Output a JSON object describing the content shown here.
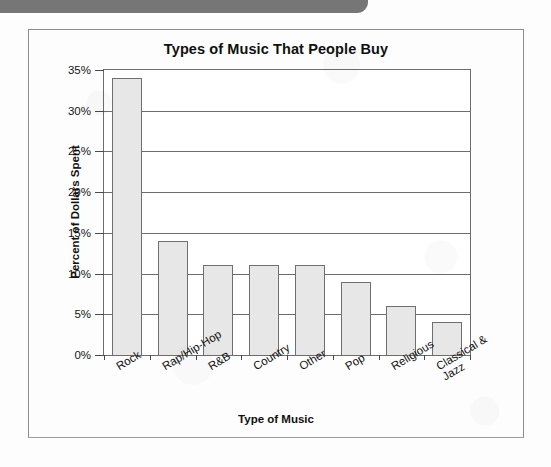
{
  "page": {
    "banner": {
      "name": "top-banner",
      "color": "#767676"
    },
    "frame_border_color": "#8c8c8c"
  },
  "chart_data": {
    "type": "bar",
    "title": "Types of Music That People Buy",
    "xlabel": "Type of Music",
    "ylabel": "Percent of Dollars Spent",
    "categories": [
      "Rock",
      "Rap/Hip-Hop",
      "R&B",
      "Country",
      "Other",
      "Pop",
      "Religious",
      "Classical & Jazz"
    ],
    "category_lines": [
      [
        "Rock"
      ],
      [
        "Rap/Hip-Hop"
      ],
      [
        "R&B"
      ],
      [
        "Country"
      ],
      [
        "Other"
      ],
      [
        "Pop"
      ],
      [
        "Religious"
      ],
      [
        "Classical &",
        "Jazz"
      ]
    ],
    "values": [
      34,
      14,
      11,
      11,
      11,
      9,
      6,
      4
    ],
    "value_unit": "%",
    "ylim": [
      0,
      35
    ],
    "ytick_values": [
      0,
      5,
      10,
      15,
      20,
      25,
      30,
      35
    ],
    "ytick_labels": [
      "0%",
      "5%",
      "10%",
      "15%",
      "20%",
      "25%",
      "30%",
      "35%"
    ],
    "grid": "horizontal",
    "legend": "none",
    "bar_fill_color": "#e7e7e7",
    "bar_border_color": "#6f6f6f",
    "axis_color": "#6d6d6d",
    "label_rotation_degrees": -31
  }
}
